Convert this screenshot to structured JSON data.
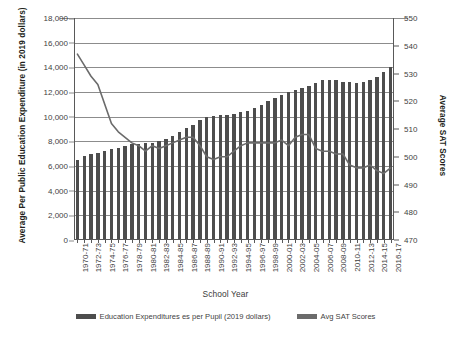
{
  "chart_data": {
    "type": "bar",
    "title": "",
    "xlabel": "School Year",
    "ylabel": "Average Per Public Education Expenditure (in 2019 dollars)",
    "y2label": "Average SAT Scores",
    "ylim": [
      0,
      18000
    ],
    "y2lim": [
      470,
      550
    ],
    "grid": true,
    "legend_position": "bottom",
    "y_ticks": [
      "0",
      "2,000",
      "4,000",
      "6,000",
      "8,000",
      "10,000",
      "12,000",
      "14,000",
      "16,000",
      "18,000"
    ],
    "y_tick_values": [
      0,
      2000,
      4000,
      6000,
      8000,
      10000,
      12000,
      14000,
      16000,
      18000
    ],
    "y2_ticks": [
      "470",
      "480",
      "490",
      "500",
      "510",
      "520",
      "530",
      "540",
      "550"
    ],
    "y2_tick_values": [
      470,
      480,
      490,
      500,
      510,
      520,
      530,
      540,
      550
    ],
    "categories": [
      "1970-71",
      "1971-72",
      "1972-73",
      "1973-74",
      "1974-75",
      "1975-76",
      "1976-77",
      "1977-78",
      "1978-79",
      "1979-80",
      "1980-81",
      "1981-82",
      "1982-83",
      "1983-84",
      "1984-85",
      "1985-86",
      "1986-87",
      "1987-88",
      "1988-89",
      "1989-90",
      "1990-91",
      "1991-92",
      "1992-93",
      "1993-94",
      "1994-95",
      "1995-96",
      "1996-97",
      "1997-98",
      "1998-99",
      "1999-00",
      "2000-01",
      "2001-02",
      "2002-03",
      "2003-04",
      "2004-05",
      "2005-06",
      "2006-07",
      "2007-08",
      "2008-09",
      "2009-10",
      "2010-11",
      "2011-12",
      "2012-13",
      "2013-14",
      "2014-15",
      "2015-16",
      "2016-17"
    ],
    "x_tick_labels": [
      "1970-71",
      "1972-73",
      "1974-75",
      "1976-77",
      "1978-79",
      "1980-81",
      "1982-83",
      "1984-85",
      "1986-87",
      "1988-89",
      "1990-91",
      "1992-93",
      "1994-95",
      "1996-97",
      "1998-99",
      "2000-01",
      "2002-03",
      "2004-05",
      "2006-07",
      "2008-09",
      "2010-11",
      "2012-13",
      "2014-15",
      "2016-17"
    ],
    "series": [
      {
        "name": "Education Expenditures es per Pupil (2019 dollars)",
        "type": "bar",
        "axis": "left",
        "color": "#4d4d4d",
        "values": [
          6500,
          6850,
          6950,
          7050,
          7200,
          7400,
          7500,
          7650,
          7750,
          7800,
          7850,
          7900,
          8000,
          8150,
          8400,
          8750,
          9050,
          9350,
          9700,
          9950,
          10050,
          10100,
          10150,
          10250,
          10350,
          10500,
          10700,
          10950,
          11250,
          11550,
          11750,
          12000,
          12150,
          12300,
          12500,
          12750,
          12950,
          13000,
          12950,
          12850,
          12800,
          12750,
          12800,
          12950,
          13200,
          13600,
          14000
        ]
      },
      {
        "name": "Avg SAT Scores",
        "type": "line",
        "axis": "right",
        "color": "#6b6b6b",
        "values": [
          537,
          533,
          529,
          526,
          519,
          512,
          509,
          507,
          505,
          504,
          502,
          504,
          503,
          504,
          505,
          506,
          507,
          507,
          504,
          500,
          499,
          500,
          500,
          502,
          504,
          505,
          505,
          505,
          505,
          505,
          506,
          504,
          507,
          508,
          508,
          503,
          502,
          502,
          501,
          501,
          497,
          496,
          496,
          497,
          495,
          494,
          496
        ]
      }
    ]
  },
  "legend": [
    {
      "label": "Education Expenditures es per Pupil (2019 dollars)",
      "color": "#4d4d4d"
    },
    {
      "label": "Avg SAT Scores",
      "color": "#6b6b6b"
    }
  ],
  "axis_titles": {
    "left": "Average Per Public Education Expenditure (in 2019 dollars)",
    "right": "Average SAT Scores",
    "bottom": "School Year"
  }
}
